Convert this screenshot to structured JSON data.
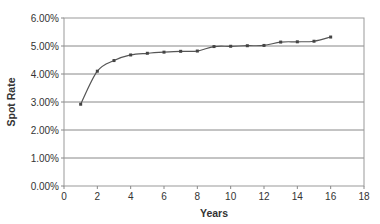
{
  "chart_data": {
    "type": "line",
    "title": "",
    "xlabel": "Years",
    "ylabel": "Spot Rate",
    "x": [
      1,
      2,
      3,
      4,
      5,
      6,
      7,
      8,
      9,
      10,
      11,
      12,
      13,
      14,
      15,
      16
    ],
    "series": [
      {
        "name": "Spot Rate",
        "values": [
          2.92,
          4.1,
          4.48,
          4.68,
          4.74,
          4.78,
          4.81,
          4.82,
          4.98,
          4.99,
          5.01,
          5.02,
          5.14,
          5.15,
          5.17,
          5.32
        ]
      }
    ],
    "xlim": [
      0,
      18
    ],
    "ylim": [
      0,
      6
    ],
    "x_ticks": [
      "0",
      "2",
      "4",
      "6",
      "8",
      "10",
      "12",
      "14",
      "16",
      "18"
    ],
    "y_ticks": [
      "0.00%",
      "1.00%",
      "2.00%",
      "3.00%",
      "4.00%",
      "5.00%",
      "6.00%"
    ],
    "grid": "horizontal",
    "legend": "none",
    "colors": {
      "line": "#555555",
      "marker": "#444444",
      "grid": "#888888",
      "axis": "#888888"
    }
  }
}
